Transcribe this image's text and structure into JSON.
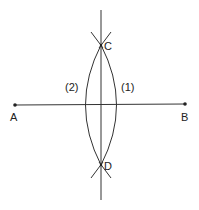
{
  "diagram": {
    "points": {
      "A": {
        "label": "A",
        "x": 15,
        "y": 105
      },
      "B": {
        "label": "B",
        "x": 185,
        "y": 104
      },
      "C": {
        "label": "C",
        "x": 101,
        "y": 45
      },
      "D": {
        "label": "D",
        "x": 101,
        "y": 165
      }
    },
    "arcs": {
      "arc1": {
        "label": "(1)"
      },
      "arc2": {
        "label": "(2)"
      }
    },
    "colors": {
      "stroke": "#333333",
      "background": "#ffffff"
    }
  }
}
